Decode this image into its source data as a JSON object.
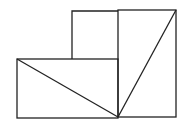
{
  "diagram": {
    "stroke_color": "#222222",
    "background": "#ffffff",
    "shapes": {
      "upper_square": {
        "x": 72,
        "y": 11,
        "w": 46,
        "h": 48
      },
      "right_rectangle": {
        "x": 118,
        "y": 10,
        "w": 58,
        "h": 107
      },
      "lower_left_rectangle": {
        "x": 17,
        "y": 59,
        "w": 101,
        "h": 59
      }
    },
    "diagonals": [
      {
        "name": "left-diagonal",
        "x1": 17,
        "y1": 59,
        "x2": 118,
        "y2": 117
      },
      {
        "name": "right-diagonal",
        "x1": 118,
        "y1": 117,
        "x2": 176,
        "y2": 10
      }
    ]
  }
}
